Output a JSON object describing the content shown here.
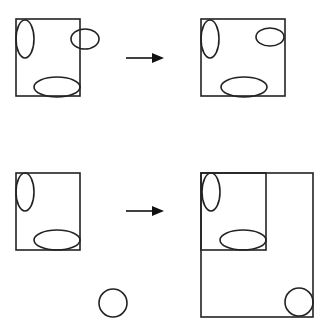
{
  "diagram": {
    "stroke_color": "#222222",
    "background": "#ffffff",
    "rows": [
      {
        "id": "row-1",
        "before": {
          "container": "square",
          "shapes": [
            "tall-ellipse-left",
            "ellipse-right-overflowing",
            "wide-ellipse-bottom"
          ]
        },
        "arrow": "right-arrow",
        "after": {
          "container": "square",
          "shapes": [
            "tall-ellipse-left",
            "ellipse-right-inside",
            "wide-ellipse-bottom"
          ]
        }
      },
      {
        "id": "row-2",
        "before": {
          "container": "square",
          "shapes": [
            "tall-ellipse-left",
            "wide-ellipse-bottom"
          ],
          "outside_shapes": [
            "circle"
          ]
        },
        "arrow": "right-arrow",
        "after": {
          "container": "expanded-rectangle-containing-original-square",
          "shapes": [
            "tall-ellipse-left",
            "wide-ellipse-bottom",
            "circle-bottom-right"
          ]
        }
      }
    ]
  }
}
